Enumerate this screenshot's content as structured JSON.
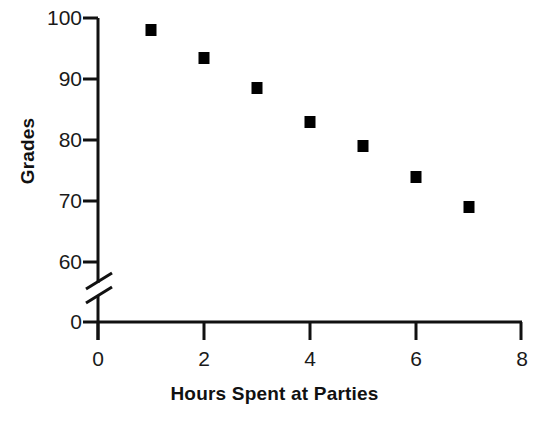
{
  "chart_data": {
    "type": "scatter",
    "title": "",
    "xlabel": "Hours Spent at Parties",
    "ylabel": "Grades",
    "x": [
      1,
      2,
      3,
      4,
      5,
      6,
      7
    ],
    "values": [
      98,
      93.5,
      88.5,
      83,
      79,
      74,
      69
    ],
    "series": [
      {
        "name": "Grades vs Hours",
        "points": [
          {
            "x": 1,
            "y": 98
          },
          {
            "x": 2,
            "y": 93.5
          },
          {
            "x": 3,
            "y": 88.5
          },
          {
            "x": 4,
            "y": 83
          },
          {
            "x": 5,
            "y": 79
          },
          {
            "x": 6,
            "y": 74
          },
          {
            "x": 7,
            "y": 69
          }
        ]
      }
    ],
    "xlim": [
      0,
      8
    ],
    "ylim": [
      0,
      100
    ],
    "xticks": [
      "0",
      "2",
      "4",
      "6",
      "8"
    ],
    "xtick_values": [
      0,
      2,
      4,
      6,
      8
    ],
    "yticks": [
      "0",
      "60",
      "70",
      "80",
      "90",
      "100"
    ],
    "ytick_values": [
      0,
      60,
      70,
      80,
      90,
      100
    ],
    "y_axis_break": true,
    "y_axis_break_between": [
      0,
      60
    ],
    "grid": false,
    "legend": false,
    "marker_shape": "square",
    "marker_color": "#000000",
    "axis_color": "#111111"
  },
  "axes": {
    "x_title": "Hours Spent at Parties",
    "y_title": "Grades"
  }
}
